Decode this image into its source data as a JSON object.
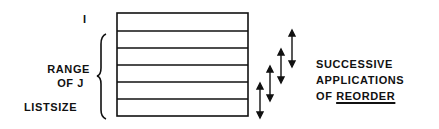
{
  "labels": {
    "i": "I",
    "range_line1": "RANGE",
    "range_line2": "OF  J",
    "listsize": "LISTSIZE",
    "caption_line1": "SUCCESSIVE",
    "caption_line2": "APPLICATIONS",
    "caption_line3_prefix": "OF ",
    "caption_line3_emph": "REORDER"
  },
  "list_box": {
    "rows": 6,
    "row_boundaries_y": [
      13,
      31,
      48,
      65,
      82,
      99,
      116
    ]
  },
  "arrows": [
    {
      "x": 260,
      "y1": 84,
      "y2": 117
    },
    {
      "x": 270,
      "y1": 67,
      "y2": 100
    },
    {
      "x": 281,
      "y1": 50,
      "y2": 82
    },
    {
      "x": 292,
      "y1": 31,
      "y2": 66
    }
  ],
  "colors": {
    "ink": "#111111",
    "background": "#ffffff"
  }
}
